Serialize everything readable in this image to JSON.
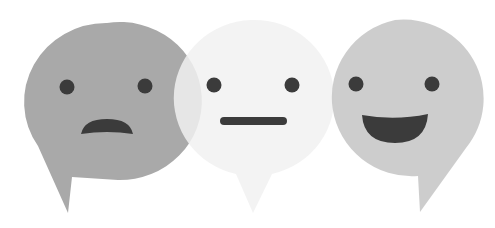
{
  "illustration": {
    "description": "Three overlapping speech bubbles with sad, neutral and happy faces",
    "background": "#ffffff",
    "bubbles": [
      {
        "mood": "sad",
        "fill": "#a9a9a9",
        "feature_color": "#3b3b3b"
      },
      {
        "mood": "neutral",
        "fill": "#f1f1f1",
        "opacity": 0.85,
        "feature_color": "#3b3b3b"
      },
      {
        "mood": "happy",
        "fill": "#c9c9c9",
        "opacity": 0.92,
        "feature_color": "#3b3b3b"
      }
    ]
  }
}
